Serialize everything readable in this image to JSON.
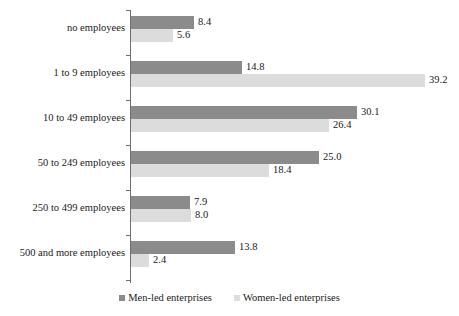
{
  "chart_data": {
    "type": "bar",
    "orientation": "horizontal",
    "title": "",
    "xlabel": "",
    "ylabel": "",
    "grid": false,
    "xlim": [
      0,
      42
    ],
    "legend_position": "bottom-center",
    "categories": [
      "no employees",
      "1 to 9 employees",
      "10 to 49 employees",
      "50 to 249 employees",
      "250 to 499 employees",
      "500 and more employees"
    ],
    "series": [
      {
        "name": "Men-led enterprises",
        "color": "#8b8b8b",
        "values": [
          8.4,
          14.8,
          30.1,
          25.0,
          7.9,
          13.8
        ],
        "labels": [
          "8.4",
          "14.8",
          "30.1",
          "25.0",
          "7.9",
          "13.8"
        ]
      },
      {
        "name": "Women-led enterprises",
        "color": "#dcdcdc",
        "values": [
          5.6,
          39.2,
          26.4,
          18.4,
          8.0,
          2.4
        ],
        "labels": [
          "5.6",
          "39.2",
          "26.4",
          "18.4",
          "8.0",
          "2.4"
        ]
      }
    ]
  },
  "legend": {
    "items": [
      {
        "label": "Men-led enterprises",
        "color": "#8b8b8b"
      },
      {
        "label": "Women-led enterprises",
        "color": "#dcdcdc"
      }
    ]
  },
  "axis": {
    "color": "#6f6f6f"
  }
}
